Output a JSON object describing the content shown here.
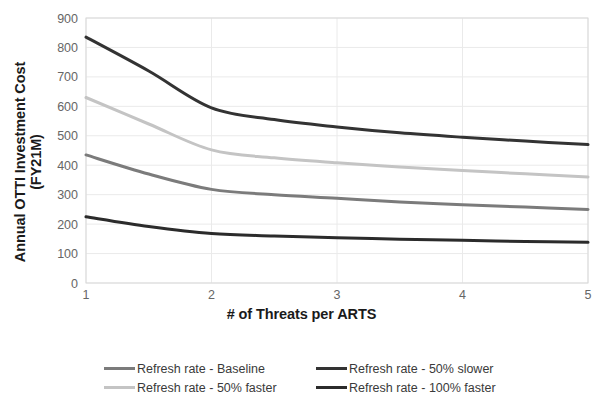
{
  "chart_data": {
    "type": "line",
    "title": "",
    "xlabel": "# of Threats per ARTS",
    "ylabel": "Annual OTTI Investment Cost (FY21M)",
    "ylabel_line1": "Annual OTTI Investment Cost",
    "ylabel_line2": "(FY21M)",
    "x": [
      1,
      1.5,
      2,
      2.5,
      3,
      3.5,
      4,
      4.5,
      5
    ],
    "xlim": [
      1,
      5
    ],
    "ylim": [
      0,
      900
    ],
    "xticks": [
      "1",
      "2",
      "3",
      "4",
      "5"
    ],
    "yticks": [
      "0",
      "100",
      "200",
      "300",
      "400",
      "500",
      "600",
      "700",
      "800",
      "900"
    ],
    "grid": true,
    "legend_position": "bottom",
    "series": [
      {
        "name": "Refresh rate - Baseline",
        "color": "#7b7b7b",
        "values": [
          435,
          370,
          318,
          300,
          288,
          275,
          266,
          258,
          250
        ]
      },
      {
        "name": "Refresh rate - 50% slower",
        "color": "#333333",
        "values": [
          835,
          720,
          595,
          555,
          530,
          510,
          495,
          482,
          470
        ]
      },
      {
        "name": "Refresh rate - 50% faster",
        "color": "#c4c4c4",
        "values": [
          630,
          540,
          452,
          425,
          408,
          394,
          382,
          371,
          360
        ]
      },
      {
        "name": "Refresh rate - 100% faster",
        "color": "#2b2b2b",
        "values": [
          225,
          192,
          168,
          160,
          154,
          149,
          145,
          141,
          138
        ]
      }
    ],
    "legend_order": [
      "Refresh rate - Baseline",
      "Refresh rate - 50% slower",
      "Refresh rate - 50% faster",
      "Refresh rate - 100% faster"
    ]
  },
  "legend": {
    "items": [
      {
        "label": "Refresh rate - Baseline",
        "color": "#7b7b7b"
      },
      {
        "label": "Refresh rate - 50% slower",
        "color": "#333333"
      },
      {
        "label": "Refresh rate - 50% faster",
        "color": "#c4c4c4"
      },
      {
        "label": "Refresh rate - 100% faster",
        "color": "#2b2b2b"
      }
    ]
  },
  "axes": {
    "x_title": "# of Threats per ARTS",
    "y_title_line1": "Annual OTTI Investment Cost",
    "y_title_line2": "(FY21M)"
  },
  "colors": {
    "grid": "#eaeaea",
    "frame": "#d9d9d9",
    "tick_text": "#666666",
    "axis_title": "#1a1a1a"
  }
}
